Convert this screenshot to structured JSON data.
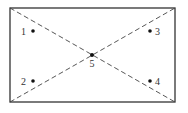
{
  "diagram": {
    "title": "",
    "rectangle": {
      "x": 10,
      "y": 8,
      "width": 165,
      "height": 94,
      "stroke": "#333333"
    },
    "diagonals": {
      "stroke": "#444444",
      "style": "dashed"
    },
    "points": [
      {
        "id": "1",
        "label": "1",
        "cx": 33,
        "cy": 31,
        "label_x": 26,
        "label_y": 34.5,
        "anchor": "end"
      },
      {
        "id": "2",
        "label": "2",
        "cx": 33,
        "cy": 81,
        "label_x": 26,
        "label_y": 84.5,
        "anchor": "end"
      },
      {
        "id": "3",
        "label": "3",
        "cx": 150,
        "cy": 31,
        "label_x": 155,
        "label_y": 34.5,
        "anchor": "start"
      },
      {
        "id": "4",
        "label": "4",
        "cx": 150,
        "cy": 81,
        "label_x": 155,
        "label_y": 84.5,
        "anchor": "start"
      },
      {
        "id": "5",
        "label": "5",
        "cx": 92,
        "cy": 55,
        "label_x": 92,
        "label_y": 67,
        "anchor": "middle"
      }
    ]
  }
}
